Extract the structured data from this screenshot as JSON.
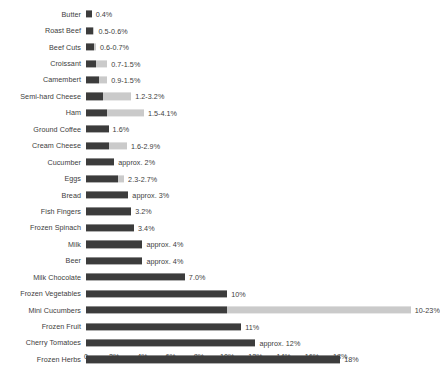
{
  "chart_data": {
    "type": "bar",
    "orientation": "horizontal",
    "title": "",
    "subtitle": "",
    "xlabel": "",
    "ylabel": "",
    "xlim": [
      0,
      18
    ],
    "grid": false,
    "legend": null,
    "colors": {
      "bar_main": "#3c3c3c",
      "bar_extension": "#cacaca",
      "background": "#ffffff",
      "text": "#3d3d3d"
    },
    "axis": {
      "tick_labels": [
        "0",
        "2%",
        "4%",
        "6%",
        "8%",
        "10%",
        "12%",
        "14%",
        "16%",
        "18%"
      ],
      "tick_values": [
        0,
        2,
        4,
        6,
        8,
        10,
        12,
        14,
        16,
        18
      ]
    },
    "categories": [
      "Butter",
      "Roast Beef",
      "Beef Cuts",
      "Croissant",
      "Camembert",
      "Semi-hard Cheese",
      "Ham",
      "Ground Coffee",
      "Cream Cheese",
      "Cucumber",
      "Eggs",
      "Bread",
      "Fish Fingers",
      "Frozen Spinach",
      "Milk",
      "Beer",
      "Milk Chocolate",
      "Frozen Vegetables",
      "Mini Cucumbers",
      "Frozen Fruit",
      "Cherry Tomatoes",
      "Frozen Herbs"
    ],
    "values_low": [
      0.4,
      0.5,
      0.6,
      0.7,
      0.9,
      1.2,
      1.5,
      1.6,
      1.6,
      2.0,
      2.3,
      3.0,
      3.2,
      3.4,
      4.0,
      4.0,
      7.0,
      10.0,
      10.0,
      11.0,
      12.0,
      18.0
    ],
    "values_high": [
      0.4,
      0.6,
      0.7,
      1.5,
      1.5,
      3.2,
      4.1,
      1.6,
      2.9,
      2.0,
      2.7,
      3.0,
      3.2,
      3.4,
      4.0,
      4.0,
      7.0,
      10.0,
      23.0,
      11.0,
      12.0,
      18.0
    ],
    "value_labels": [
      "0.4%",
      "0.5-0.6%",
      "0.6-0.7%",
      "0.7-1.5%",
      "0.9-1.5%",
      "1.2-3.2%",
      "1.5-4.1%",
      "1.6%",
      "1.6-2.9%",
      "approx. 2%",
      "2.3-2.7%",
      "approx. 3%",
      "3.2%",
      "3.4%",
      "approx. 4%",
      "approx. 4%",
      "7.0%",
      "10%",
      "10-23%",
      "11%",
      "approx. 12%",
      "18%"
    ]
  }
}
